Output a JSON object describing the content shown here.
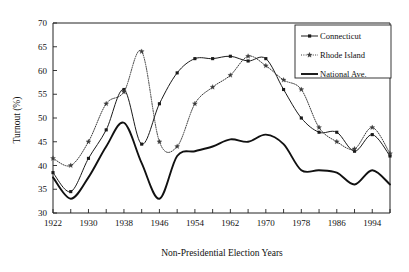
{
  "chart_data": {
    "type": "line",
    "title": "",
    "xlabel": "Non-Presidential Election Years",
    "ylabel": "Turnout (%)",
    "xlim": [
      1922,
      1998
    ],
    "ylim": [
      30,
      70
    ],
    "ytick_step": 5,
    "xtick_step": 4,
    "xtick_label_step": 8,
    "grid": false,
    "legend_position": "top-right",
    "x": [
      1922,
      1926,
      1930,
      1934,
      1938,
      1942,
      1946,
      1950,
      1954,
      1958,
      1962,
      1966,
      1970,
      1974,
      1978,
      1982,
      1986,
      1990,
      1994,
      1998
    ],
    "xticklabels": [
      "1922",
      "1930",
      "1938",
      "1946",
      "1954",
      "1962",
      "1970",
      "1978",
      "1986",
      "1994"
    ],
    "yticklabels": [
      "30",
      "35",
      "40",
      "45",
      "50",
      "55",
      "60",
      "65",
      "70"
    ],
    "series": [
      {
        "name": "Connecticut",
        "style": "solid-with-markers",
        "marker": "square",
        "color": "#1a1a1a",
        "values": [
          38.5,
          34.5,
          41.5,
          47.5,
          56.0,
          44.5,
          53.0,
          59.5,
          62.5,
          62.5,
          63.0,
          62.0,
          62.5,
          56.0,
          50.0,
          47.0,
          47.0,
          43.0,
          46.5,
          42.0
        ]
      },
      {
        "name": "Rhode Island",
        "style": "dotted-with-markers",
        "marker": "star",
        "color": "#3a3a3a",
        "values": [
          41.5,
          40.0,
          45.0,
          53.0,
          55.5,
          64.0,
          45.0,
          44.0,
          53.0,
          56.5,
          59.0,
          63.0,
          61.0,
          58.0,
          56.0,
          48.0,
          45.0,
          43.5,
          48.0,
          42.5
        ]
      },
      {
        "name": "National Ave.",
        "style": "solid-thick",
        "marker": "none",
        "color": "#111111",
        "values": [
          37.5,
          33.0,
          37.5,
          44.0,
          49.0,
          40.5,
          33.0,
          42.0,
          43.0,
          44.0,
          45.5,
          45.0,
          46.5,
          44.5,
          39.0,
          39.0,
          38.5,
          36.0,
          39.0,
          36.0
        ]
      }
    ]
  },
  "legend": {
    "items": [
      {
        "label": "Connecticut",
        "key": "connecticut"
      },
      {
        "label": "Rhode Island",
        "key": "rhode-island"
      },
      {
        "label": "National Ave.",
        "key": "national-ave"
      }
    ]
  }
}
